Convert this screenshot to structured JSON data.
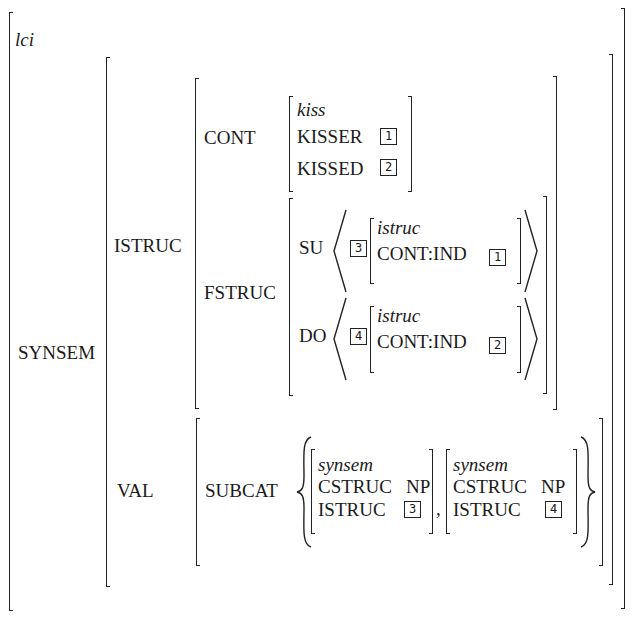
{
  "avm": {
    "type": "lci",
    "synsem": {
      "label": "SYNSEM",
      "istruc": {
        "label": "ISTRUC",
        "cont": {
          "label": "CONT",
          "type": "kiss",
          "kisser_label": "KISSER",
          "kisser_tag": "1",
          "kissed_label": "KISSED",
          "kissed_tag": "2"
        },
        "fstruc": {
          "label": "FSTRUC",
          "su": {
            "label": "SU",
            "tag": "3",
            "type": "istruc",
            "feature": "CONT:IND",
            "value_tag": "1"
          },
          "do": {
            "label": "DO",
            "tag": "4",
            "type": "istruc",
            "feature": "CONT:IND",
            "value_tag": "2"
          }
        }
      },
      "val": {
        "label": "VAL",
        "subcat": {
          "label": "SUBCAT",
          "separator": ",",
          "items": [
            {
              "type": "synsem",
              "cstruc_label": "CSTRUC",
              "cstruc_value": "NP",
              "istruc_label": "ISTRUC",
              "istruc_tag": "3"
            },
            {
              "type": "synsem",
              "cstruc_label": "CSTRUC",
              "cstruc_value": "NP",
              "istruc_label": "ISTRUC",
              "istruc_tag": "4"
            }
          ]
        }
      }
    }
  }
}
